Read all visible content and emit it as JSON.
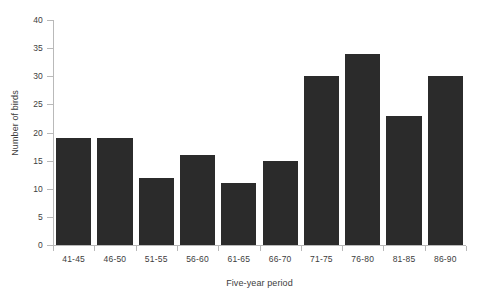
{
  "chart_data": {
    "type": "bar",
    "title": "",
    "categories": [
      "41-45",
      "46-50",
      "51-55",
      "56-60",
      "61-65",
      "66-70",
      "71-75",
      "76-80",
      "81-85",
      "86-90"
    ],
    "values": [
      19,
      19,
      12,
      16,
      11,
      15,
      30,
      34,
      23,
      30
    ],
    "xlabel": "Five-year period",
    "ylabel": "Number of birds",
    "ylim": [
      0,
      40
    ],
    "ytick_step": 5,
    "yticks": [
      0,
      5,
      10,
      15,
      20,
      25,
      30,
      35,
      40
    ],
    "grid": false,
    "legend": null,
    "bar_color": "#2b2b2b",
    "axis_color": "#b9b9b9",
    "background_color": "#ffffff"
  }
}
